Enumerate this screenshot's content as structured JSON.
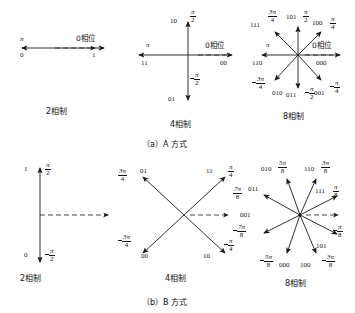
{
  "figure": {
    "caption_a": "（a）A 方式",
    "caption_b": "（b）B 方式",
    "phase_word": "相位",
    "labels": {
      "two_phase": "2相制",
      "four_phase": "4相制",
      "eight_phase": "8相制",
      "zero_phase": "0相位"
    },
    "colors": {
      "line": "#1a1a1a",
      "dash": "#3a3a3a",
      "text": "#111111",
      "background": "#ffffff"
    }
  },
  "panel_a": {
    "name": "A 方式",
    "two_phase": {
      "title": "2相制",
      "reference_label": "0相位",
      "vectors": [
        {
          "bits": "0",
          "angle_text": "π",
          "direction_deg": 180
        },
        {
          "bits": "1",
          "angle_text": "0",
          "direction_deg": 0
        }
      ]
    },
    "four_phase": {
      "title": "4相制",
      "reference_label": "0相位",
      "vectors": [
        {
          "bits": "10",
          "angle_num": "π",
          "angle_den": "2",
          "direction_deg": 90
        },
        {
          "bits": "11",
          "angle_text": "π",
          "direction_deg": 180
        },
        {
          "bits": "01",
          "angle_num": "π",
          "angle_den": "2",
          "negative": true,
          "direction_deg": 270
        },
        {
          "bits": "00",
          "angle_text": "0",
          "direction_deg": 0
        }
      ]
    },
    "eight_phase": {
      "title": "8相制",
      "reference_label": "0相位",
      "vectors": [
        {
          "bits": "101",
          "angle_num": "π",
          "angle_den": "2",
          "direction_deg": 90
        },
        {
          "bits": "111",
          "angle_num": "3π",
          "angle_den": "4",
          "direction_deg": 135
        },
        {
          "bits": "110",
          "angle_text": "π",
          "direction_deg": 180
        },
        {
          "bits": "010",
          "angle_num": "3π",
          "angle_den": "4",
          "negative": true,
          "direction_deg": 225
        },
        {
          "bits": "011",
          "angle_num": "π",
          "angle_den": "2",
          "negative": true,
          "direction_deg": 270
        },
        {
          "bits": "001",
          "angle_num": "π",
          "angle_den": "4",
          "negative": true,
          "direction_deg": 315
        },
        {
          "bits": "000",
          "angle_text": "0",
          "direction_deg": 0
        },
        {
          "bits": "100",
          "angle_num": "π",
          "angle_den": "4",
          "direction_deg": 45
        }
      ]
    }
  },
  "panel_b": {
    "name": "B 方式",
    "two_phase": {
      "title": "2相制",
      "vectors": [
        {
          "bits": "1",
          "angle_num": "π",
          "angle_den": "2",
          "direction_deg": 90
        },
        {
          "bits": "0",
          "angle_num": "π",
          "angle_den": "2",
          "negative": true,
          "direction_deg": 270
        }
      ]
    },
    "four_phase": {
      "title": "4相制",
      "vectors": [
        {
          "bits": "01",
          "angle_num": "3π",
          "angle_den": "4",
          "direction_deg": 135
        },
        {
          "bits": "11",
          "angle_num": "π",
          "angle_den": "4",
          "direction_deg": 45
        },
        {
          "bits": "00",
          "angle_num": "3π",
          "angle_den": "4",
          "negative": true,
          "direction_deg": 225
        },
        {
          "bits": "10",
          "angle_num": "π",
          "angle_den": "4",
          "negative": true,
          "direction_deg": 315
        }
      ]
    },
    "eight_phase": {
      "title": "8相制",
      "vectors": [
        {
          "bits": "010",
          "angle_num": "5π",
          "angle_den": "8",
          "direction_deg": 112.5
        },
        {
          "bits": "110",
          "angle_num": "3π",
          "angle_den": "8",
          "direction_deg": 67.5
        },
        {
          "bits": "011",
          "angle_num": "7π",
          "angle_den": "8",
          "direction_deg": 157.5
        },
        {
          "bits": "111",
          "angle_num": "π",
          "angle_den": "8",
          "direction_deg": 22.5
        },
        {
          "bits": "001",
          "angle_num": "7π",
          "angle_den": "8",
          "negative": true,
          "direction_deg": 202.5
        },
        {
          "bits": "101",
          "angle_num": "π",
          "angle_den": "8",
          "negative": true,
          "direction_deg": 337.5
        },
        {
          "bits": "000",
          "angle_num": "5π",
          "angle_den": "8",
          "negative": true,
          "direction_deg": 247.5
        },
        {
          "bits": "100",
          "angle_num": "3π",
          "angle_den": "8",
          "negative": true,
          "direction_deg": 292.5
        }
      ]
    }
  }
}
